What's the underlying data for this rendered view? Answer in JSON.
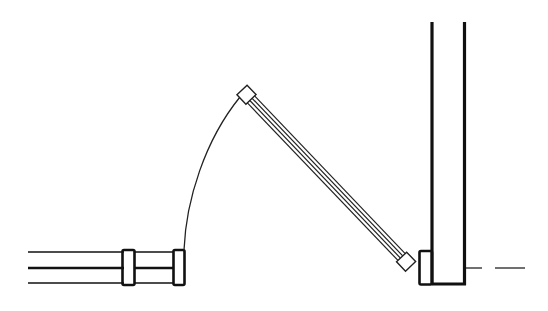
{
  "diagram": {
    "type": "architectural-floor-plan",
    "colors": {
      "background": "#ffffff",
      "line": "#111111",
      "arc": "#222222"
    },
    "elements": [
      {
        "id": "left-wall",
        "label": "Left partition wall with jamb blocks"
      },
      {
        "id": "door-leaf",
        "label": "Door leaf (open, angled)"
      },
      {
        "id": "swing-arc",
        "label": "Door swing arc"
      },
      {
        "id": "right-wall",
        "label": "Vertical wall with jamb"
      },
      {
        "id": "centerline",
        "label": "Dashed centerline"
      }
    ]
  }
}
